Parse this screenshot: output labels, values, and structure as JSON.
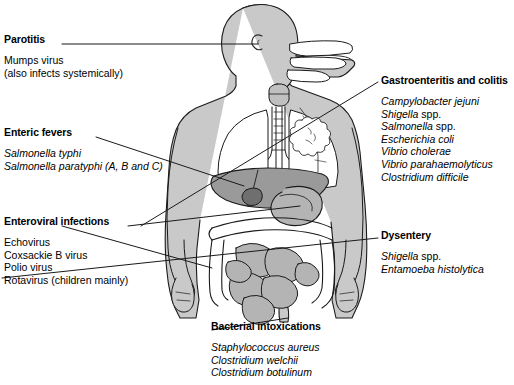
{
  "diagram": {
    "figure_caption": "Human torso in profile showing the alimentary tract",
    "colors": {
      "body_fill": "#c9c9c9",
      "organ_fill": "#b4b4b4",
      "liver_fill": "#9a9a9a",
      "gallbladder_fill": "#6f6f6f",
      "cavity_fill": "#ffffff",
      "outline": "#1a1a1a",
      "text": "#000000"
    }
  },
  "labels": [
    {
      "id": "parotitis",
      "header": "Parotitis",
      "items": [
        {
          "text": "Mumps virus",
          "italic": false
        },
        {
          "text": "(also infects systemically)",
          "italic": false
        }
      ]
    },
    {
      "id": "enteric_fevers",
      "header": "Enteric fevers",
      "items": [
        {
          "text": "Salmonella typhi",
          "italic": true
        },
        {
          "text": "Salmonella paratyphi (A, B and C)",
          "italic": true
        }
      ]
    },
    {
      "id": "enteroviral_infections",
      "header": "Enteroviral infections",
      "items": [
        {
          "text": "Echovirus",
          "italic": false
        },
        {
          "text": "Coxsackie B virus",
          "italic": false
        },
        {
          "text": "Polio virus",
          "italic": false
        },
        {
          "text": "Rotavirus (children mainly)",
          "italic": false
        }
      ]
    },
    {
      "id": "gastroenteritis_and_colitis",
      "header": "Gastroenteritis and colitis",
      "items": [
        {
          "text": "Campylobacter jejuni",
          "italic": true
        },
        {
          "text": "Shigella",
          "italic": true,
          "suffix": " spp."
        },
        {
          "text": "Salmonella",
          "italic": true,
          "suffix": " spp."
        },
        {
          "text": "Escherichia coli",
          "italic": true
        },
        {
          "text": "Vibrio cholerae",
          "italic": true
        },
        {
          "text": "Vibrio parahaemolyticus",
          "italic": true
        },
        {
          "text": "Clostridium difficile",
          "italic": true
        }
      ]
    },
    {
      "id": "dysentery",
      "header": "Dysentery",
      "items": [
        {
          "text": "Shigella",
          "italic": true,
          "suffix": " spp."
        },
        {
          "text": "Entamoeba histolytica",
          "italic": true
        }
      ]
    },
    {
      "id": "bacterial_intoxications",
      "header": "Bacterial intoxications",
      "items": [
        {
          "text": "Staphylococcus aureus",
          "italic": true
        },
        {
          "text": "Clostridium welchii",
          "italic": true
        },
        {
          "text": "Clostridium botulinum",
          "italic": true
        }
      ]
    }
  ],
  "anatomy_parts": [
    "head-profile",
    "ear",
    "oral-cavity",
    "tongue",
    "pharynx",
    "larynx",
    "trachea",
    "bronchi",
    "lung",
    "esophagus",
    "liver",
    "gallbladder",
    "stomach",
    "transverse-colon",
    "ascending-colon",
    "descending-colon",
    "small-intestine",
    "rectum",
    "arm",
    "hand"
  ]
}
